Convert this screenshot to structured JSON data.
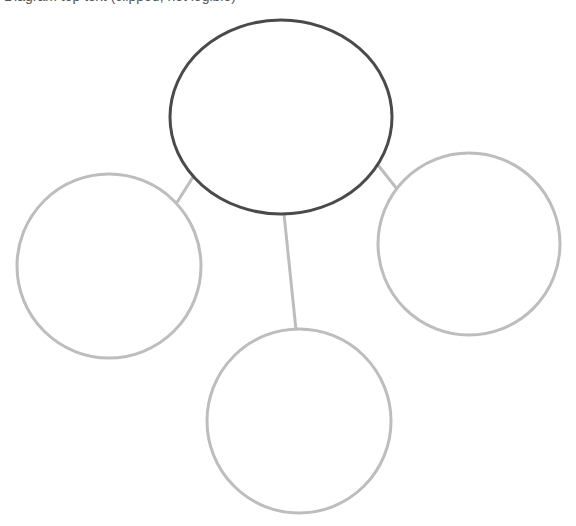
{
  "header": {
    "clipped_text": "Diagram top text (clipped, not legible)"
  },
  "diagram": {
    "type": "bubble-map",
    "colors": {
      "background": "#ffffff",
      "central_stroke": "#4a4a4a",
      "branch_stroke": "#bdbdbd",
      "connector_stroke": "#bdbdbd"
    },
    "central": {
      "label": "",
      "cx": 281,
      "cy": 117,
      "rx": 111,
      "ry": 97
    },
    "branches": [
      {
        "id": "left",
        "label": "",
        "cx": 109,
        "cy": 266,
        "r": 92
      },
      {
        "id": "right",
        "label": "",
        "cx": 469,
        "cy": 244,
        "r": 91
      },
      {
        "id": "bottom",
        "label": "",
        "cx": 299,
        "cy": 421,
        "r": 92
      }
    ],
    "connectors": [
      {
        "id": "to-left",
        "x1": 193,
        "y1": 177,
        "x2": 176,
        "y2": 204
      },
      {
        "id": "to-right",
        "x1": 378,
        "y1": 165,
        "x2": 397,
        "y2": 189
      },
      {
        "id": "to-bottom",
        "x1": 284,
        "y1": 214,
        "x2": 296,
        "y2": 330
      }
    ]
  }
}
